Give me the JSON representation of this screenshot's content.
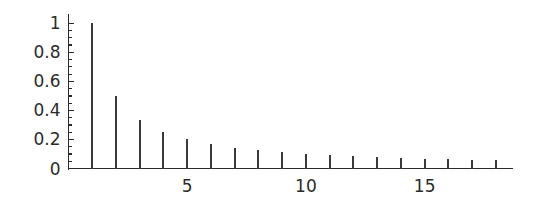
{
  "chart_data": {
    "type": "bar",
    "subtype": "stem",
    "title": "",
    "subtitle": "",
    "xlabel": "",
    "ylabel": "",
    "x": [
      1,
      2,
      3,
      4,
      5,
      6,
      7,
      8,
      9,
      10,
      11,
      12,
      13,
      14,
      15,
      16,
      17,
      18
    ],
    "values": [
      1.0,
      0.5,
      0.3333,
      0.25,
      0.2,
      0.1667,
      0.1429,
      0.125,
      0.1111,
      0.1,
      0.0909,
      0.0833,
      0.0769,
      0.0714,
      0.0667,
      0.0625,
      0.0588,
      0.0556
    ],
    "categories": [
      "1",
      "2",
      "3",
      "4",
      "5",
      "6",
      "7",
      "8",
      "9",
      "10",
      "11",
      "12",
      "13",
      "14",
      "15",
      "16",
      "17",
      "18"
    ],
    "series": [
      {
        "name": "",
        "values": [
          1.0,
          0.5,
          0.3333,
          0.25,
          0.2,
          0.1667,
          0.1429,
          0.125,
          0.1111,
          0.1,
          0.0909,
          0.0833,
          0.0769,
          0.0714,
          0.0667,
          0.0625,
          0.0588,
          0.0556
        ]
      }
    ],
    "xlim": [
      0,
      18.7
    ],
    "ylim": [
      0,
      1.04
    ],
    "grid": false,
    "legend": null,
    "legend_position": "none",
    "annotations": [],
    "y_ticks": [
      0,
      0.2,
      0.4,
      0.6,
      0.8,
      1
    ],
    "y_tick_labels": [
      "0",
      "0.2",
      "0.4",
      "0.6",
      "0.8",
      "1"
    ],
    "y_minor_tick_step": 0.05,
    "x_ticks": [
      1,
      2,
      3,
      4,
      5,
      6,
      7,
      8,
      9,
      10,
      11,
      12,
      13,
      14,
      15,
      16,
      17,
      18
    ],
    "x_tick_labels_shown": [
      "5",
      "10",
      "15"
    ],
    "x_labeled_ticks": [
      5,
      10,
      15
    ],
    "colors": {
      "stem": "#3a3a3a",
      "axis": "#2b2b2b",
      "tick": "#2b2b2b",
      "label": "#2b2b2b",
      "background": "#ffffff"
    }
  }
}
